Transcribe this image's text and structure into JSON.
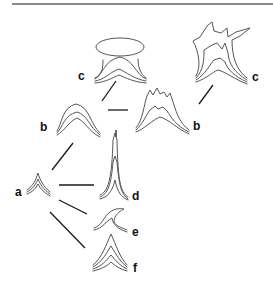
{
  "diagram": {
    "labels": {
      "a": "a",
      "b_left": "b",
      "b_right": "b",
      "c_left": "c",
      "c_right": "c",
      "d": "d",
      "e": "e",
      "f": "f"
    },
    "nodes": [
      {
        "id": "a",
        "label": "a",
        "description": "small peaked nested-curve form"
      },
      {
        "id": "b_left",
        "label": "b",
        "description": "rounded dome nested curves"
      },
      {
        "id": "b_right",
        "label": "b",
        "description": "dome with jagged crenellated top"
      },
      {
        "id": "c_left",
        "label": "c",
        "description": "mushroom form with oval cap"
      },
      {
        "id": "c_right",
        "label": "c",
        "description": "tall flaring form with spiky crown"
      },
      {
        "id": "d",
        "label": "d",
        "description": "tall narrow spike"
      },
      {
        "id": "e",
        "label": "e",
        "description": "curled hook / wave form"
      },
      {
        "id": "f",
        "label": "f",
        "description": "stacked pointed peaks"
      }
    ],
    "edges": [
      [
        "a",
        "b_left"
      ],
      [
        "a",
        "d"
      ],
      [
        "a",
        "e"
      ],
      [
        "a",
        "f"
      ],
      [
        "b_left",
        "c_left"
      ],
      [
        "b_left",
        "b_right"
      ],
      [
        "b_right",
        "c_right"
      ]
    ],
    "colors": {
      "rule": "#8a8a8a",
      "stroke": "#555555",
      "connector": "#1a1a1a",
      "label": "#111111"
    }
  }
}
